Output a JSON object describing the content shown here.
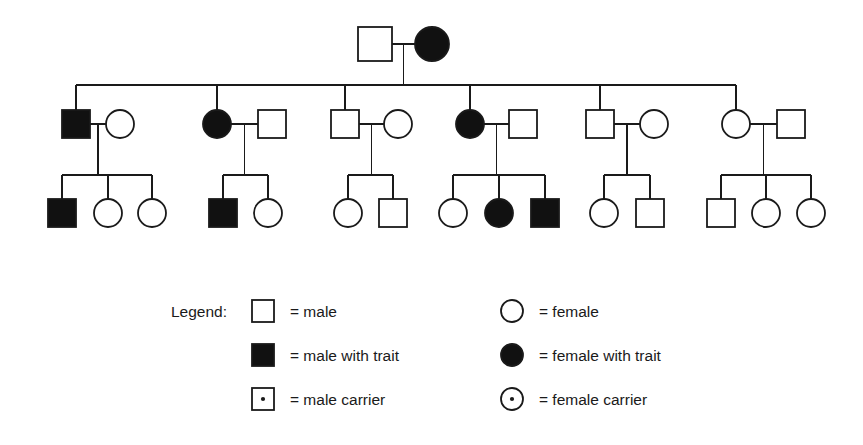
{
  "figure": {
    "type": "pedigree-chart",
    "background_color": "#ffffff",
    "line_color": "#1a1a1a",
    "fill_affected_color": "#111111",
    "fill_unaffected_color": "#ffffff",
    "generations": 3
  },
  "legend": {
    "title": "Legend:",
    "items": [
      {
        "symbol": "open-square",
        "shape": "square",
        "fill": "none",
        "carrier_dot": false,
        "text": "= male"
      },
      {
        "symbol": "filled-square",
        "shape": "square",
        "fill": "solid",
        "carrier_dot": false,
        "text": "= male with trait"
      },
      {
        "symbol": "dotted-square",
        "shape": "square",
        "fill": "none",
        "carrier_dot": true,
        "text": "= male carrier"
      },
      {
        "symbol": "open-circle",
        "shape": "circle",
        "fill": "none",
        "carrier_dot": false,
        "text": "= female"
      },
      {
        "symbol": "filled-circle",
        "shape": "circle",
        "fill": "solid",
        "carrier_dot": false,
        "text": "= female with trait"
      },
      {
        "symbol": "dotted-circle",
        "shape": "circle",
        "fill": "none",
        "carrier_dot": true,
        "text": "= female carrier"
      }
    ]
  },
  "pedigree": {
    "generation_1": {
      "label": "I",
      "members": [
        {
          "id": "I-1",
          "sex": "male",
          "affected": false,
          "x": 375,
          "y": 44
        },
        {
          "id": "I-2",
          "sex": "female",
          "affected": true,
          "x": 432,
          "y": 44
        }
      ]
    },
    "generation_2": {
      "label": "II",
      "families": [
        {
          "id": "F1",
          "descendant": {
            "id": "II-1",
            "sex": "male",
            "affected": true,
            "x": 76,
            "y": 124
          },
          "spouse": {
            "id": "II-2",
            "sex": "female",
            "affected": false,
            "x": 120,
            "y": 124
          },
          "children": [
            {
              "id": "III-1",
              "sex": "male",
              "affected": true,
              "x": 62,
              "y": 213
            },
            {
              "id": "III-2",
              "sex": "female",
              "affected": false,
              "x": 108,
              "y": 213
            },
            {
              "id": "III-3",
              "sex": "female",
              "affected": false,
              "x": 152,
              "y": 213
            }
          ]
        },
        {
          "id": "F2",
          "descendant": {
            "id": "II-3",
            "sex": "female",
            "affected": true,
            "x": 217,
            "y": 124
          },
          "spouse": {
            "id": "II-4",
            "sex": "male",
            "affected": false,
            "x": 272,
            "y": 124
          },
          "children": [
            {
              "id": "III-4",
              "sex": "male",
              "affected": true,
              "x": 223,
              "y": 213
            },
            {
              "id": "III-5",
              "sex": "female",
              "affected": false,
              "x": 268,
              "y": 213
            }
          ]
        },
        {
          "id": "F3",
          "descendant": {
            "id": "II-5",
            "sex": "male",
            "affected": false,
            "x": 345,
            "y": 124
          },
          "spouse": {
            "id": "II-6",
            "sex": "female",
            "affected": false,
            "x": 398,
            "y": 124
          },
          "children": [
            {
              "id": "III-6",
              "sex": "female",
              "affected": false,
              "x": 348,
              "y": 213
            },
            {
              "id": "III-7",
              "sex": "male",
              "affected": false,
              "x": 393,
              "y": 213
            }
          ]
        },
        {
          "id": "F4",
          "descendant": {
            "id": "II-7",
            "sex": "female",
            "affected": true,
            "x": 470,
            "y": 124
          },
          "spouse": {
            "id": "II-8",
            "sex": "male",
            "affected": false,
            "x": 523,
            "y": 124
          },
          "children": [
            {
              "id": "III-8",
              "sex": "female",
              "affected": false,
              "x": 453,
              "y": 213
            },
            {
              "id": "III-9",
              "sex": "female",
              "affected": true,
              "x": 499,
              "y": 213
            },
            {
              "id": "III-10",
              "sex": "male",
              "affected": true,
              "x": 545,
              "y": 213
            }
          ]
        },
        {
          "id": "F5",
          "descendant": {
            "id": "II-9",
            "sex": "male",
            "affected": false,
            "x": 600,
            "y": 124
          },
          "spouse": {
            "id": "II-10",
            "sex": "female",
            "affected": false,
            "x": 654,
            "y": 124
          },
          "children": [
            {
              "id": "III-11",
              "sex": "female",
              "affected": false,
              "x": 604,
              "y": 213
            },
            {
              "id": "III-12",
              "sex": "male",
              "affected": false,
              "x": 650,
              "y": 213
            }
          ]
        },
        {
          "id": "F6",
          "descendant": {
            "id": "II-11",
            "sex": "female",
            "affected": false,
            "x": 736,
            "y": 124
          },
          "spouse": {
            "id": "II-12",
            "sex": "male",
            "affected": false,
            "x": 791,
            "y": 124
          },
          "children": [
            {
              "id": "III-13",
              "sex": "male",
              "affected": false,
              "x": 721,
              "y": 213
            },
            {
              "id": "III-14",
              "sex": "female",
              "affected": false,
              "x": 766,
              "y": 213
            },
            {
              "id": "III-15",
              "sex": "female",
              "affected": false,
              "x": 811,
              "y": 213
            }
          ]
        }
      ]
    }
  }
}
